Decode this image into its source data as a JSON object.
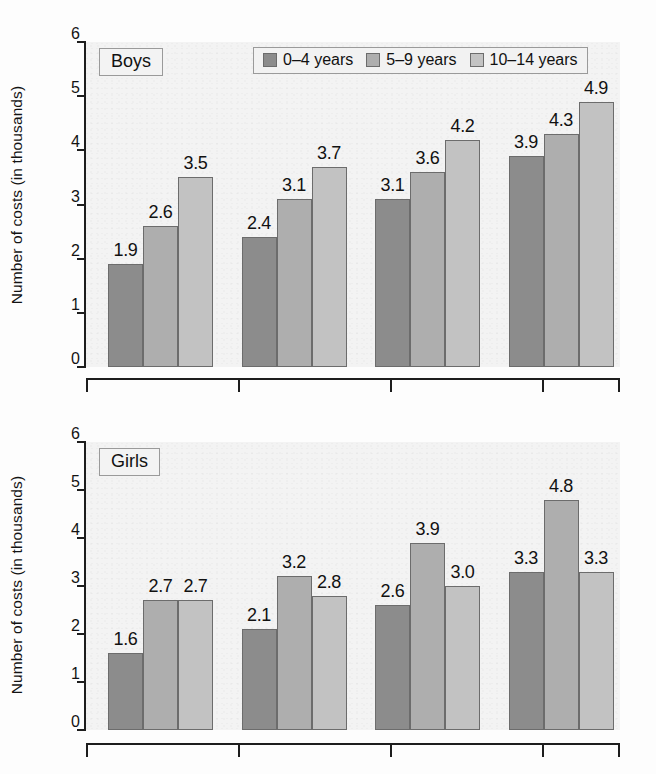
{
  "figure": {
    "background_color": "#fdfdfd",
    "plot_background_color": "#f3f3f3"
  },
  "legend": {
    "position": "top-center-of-first-panel",
    "entries": [
      {
        "label": "0–4 years",
        "color": "#8c8c8c"
      },
      {
        "label": "5–9 years",
        "color": "#aeaeae"
      },
      {
        "label": "10–14 years",
        "color": "#c3c3c3"
      }
    ]
  },
  "panels": [
    {
      "tag": "Boys",
      "ylabel": "Number of costs (in thousands)"
    },
    {
      "tag": "Girls",
      "ylabel": "Number of costs (in thousands)"
    }
  ],
  "yticks": [
    "0",
    "1",
    "2",
    "3",
    "4",
    "5",
    "6"
  ],
  "chart_data": [
    {
      "type": "bar",
      "title": "Boys",
      "xlabel": "",
      "ylabel": "Number of costs (in thousands)",
      "ylim": [
        0,
        6
      ],
      "yticks": [
        0,
        1,
        2,
        3,
        4,
        5,
        6
      ],
      "grid": false,
      "legend": "top-center",
      "categories": [
        "group-1",
        "group-2",
        "group-3",
        "group-4"
      ],
      "series": [
        {
          "name": "0–4 years",
          "color": "#8c8c8c",
          "values": [
            1.9,
            2.4,
            3.1,
            3.9
          ]
        },
        {
          "name": "5–9 years",
          "color": "#aeaeae",
          "values": [
            2.6,
            3.1,
            3.6,
            4.3
          ]
        },
        {
          "name": "10–14 years",
          "color": "#c3c3c3",
          "values": [
            3.5,
            3.7,
            4.2,
            4.9
          ]
        }
      ],
      "data_labels": [
        [
          "1.9",
          "2.6",
          "3.5"
        ],
        [
          "2.4",
          "3.1",
          "3.7"
        ],
        [
          "3.1",
          "3.6",
          "4.2"
        ],
        [
          "3.9",
          "4.3",
          "4.9"
        ]
      ]
    },
    {
      "type": "bar",
      "title": "Girls",
      "xlabel": "",
      "ylabel": "Number of costs (in thousands)",
      "ylim": [
        0,
        6
      ],
      "yticks": [
        0,
        1,
        2,
        3,
        4,
        5,
        6
      ],
      "grid": false,
      "legend": "none",
      "categories": [
        "group-1",
        "group-2",
        "group-3",
        "group-4"
      ],
      "series": [
        {
          "name": "0–4 years",
          "color": "#8c8c8c",
          "values": [
            1.6,
            2.1,
            2.6,
            3.3
          ]
        },
        {
          "name": "5–9 years",
          "color": "#aeaeae",
          "values": [
            2.7,
            3.2,
            3.9,
            4.8
          ]
        },
        {
          "name": "10–14 years",
          "color": "#c3c3c3",
          "values": [
            2.7,
            2.8,
            3.0,
            3.3
          ]
        }
      ],
      "data_labels": [
        [
          "1.6",
          "2.7",
          "2.7"
        ],
        [
          "2.1",
          "3.2",
          "2.8"
        ],
        [
          "2.6",
          "3.9",
          "3.0"
        ],
        [
          "3.3",
          "4.8",
          "3.3"
        ]
      ]
    }
  ]
}
